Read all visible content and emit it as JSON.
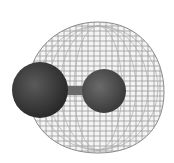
{
  "figure": {
    "colors": {
      "background": "#ffffff",
      "wireframe": "#8a8a8a",
      "atom_large": "#3a3a3a",
      "atom_small": "#4a4a4a",
      "bond": "#6a6a6a"
    }
  }
}
